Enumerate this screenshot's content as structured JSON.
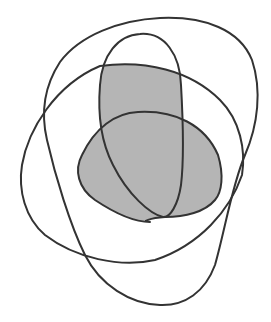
{
  "diagram": {
    "type": "venn-like closed curves",
    "curve_count": 4,
    "stroke_color": "#333333",
    "shade_color": "#b5b5b5",
    "background": "#ffffff",
    "curves": [
      {
        "id": "A",
        "description": "large outer rounded curve (top to bottom)"
      },
      {
        "id": "B",
        "description": "tall narrow oval"
      },
      {
        "id": "C",
        "description": "wide rounded blob"
      },
      {
        "id": "D",
        "description": "inner horizontal oval"
      }
    ],
    "shaded_regions": [
      {
        "id": "upper",
        "description": "inside A, B and C, outside D"
      },
      {
        "id": "lower-right",
        "description": "inside A, C and D, outside B"
      }
    ],
    "labels": []
  }
}
